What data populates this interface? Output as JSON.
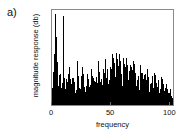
{
  "figure": {
    "panel_label": "a)",
    "background_color": "#ffffff",
    "axis_color": "#8a8a8a",
    "data_color": "#000000"
  },
  "chart_data": {
    "type": "area",
    "title": "",
    "subtitle": "",
    "xlabel": "frequency",
    "ylabel": "magnitude response (db)",
    "xlim": [
      0,
      104
    ],
    "ylim": [
      0,
      100
    ],
    "grid": false,
    "legend": null,
    "legend_position": "none",
    "xticks": [
      0,
      50,
      100
    ],
    "xticklabels": [
      "0",
      "50",
      "100"
    ],
    "yticks": [],
    "yticklabels": [],
    "x": [
      0,
      1,
      2,
      3,
      4,
      5,
      6,
      7,
      8,
      9,
      10,
      11,
      12,
      13,
      14,
      15,
      16,
      17,
      18,
      19,
      20,
      21,
      22,
      23,
      24,
      25,
      26,
      27,
      28,
      29,
      30,
      31,
      32,
      33,
      34,
      35,
      36,
      37,
      38,
      39,
      40,
      41,
      42,
      43,
      44,
      45,
      46,
      47,
      48,
      49,
      50,
      51,
      52,
      53,
      54,
      55,
      56,
      57,
      58,
      59,
      60,
      61,
      62,
      63,
      64,
      65,
      66,
      67,
      68,
      69,
      70,
      71,
      72,
      73,
      74,
      75,
      76,
      77,
      78,
      79,
      80,
      81,
      82,
      83,
      84,
      85,
      86,
      87,
      88,
      89,
      90,
      91,
      92,
      93,
      94,
      95,
      96,
      97,
      98,
      99,
      100,
      101,
      102,
      103
    ],
    "values": [
      18,
      30,
      52,
      96,
      72,
      34,
      26,
      40,
      28,
      22,
      94,
      66,
      30,
      24,
      58,
      40,
      26,
      20,
      44,
      30,
      22,
      18,
      46,
      28,
      20,
      32,
      48,
      30,
      22,
      26,
      34,
      44,
      28,
      24,
      38,
      30,
      26,
      42,
      34,
      28,
      46,
      36,
      30,
      50,
      40,
      34,
      48,
      42,
      36,
      52,
      44,
      38,
      54,
      46,
      40,
      56,
      48,
      42,
      54,
      46,
      40,
      52,
      44,
      38,
      50,
      42,
      36,
      48,
      40,
      34,
      46,
      38,
      32,
      44,
      36,
      30,
      42,
      34,
      28,
      40,
      32,
      27,
      38,
      30,
      25,
      36,
      28,
      23,
      34,
      26,
      21,
      32,
      24,
      20,
      29,
      22,
      18,
      26,
      20,
      16,
      22,
      17,
      13,
      10
    ],
    "baseline_values": [
      10,
      14,
      18,
      22,
      19,
      16,
      14,
      17,
      15,
      13,
      20,
      18,
      15,
      13,
      17,
      16,
      14,
      12,
      16,
      14,
      13,
      11,
      17,
      14,
      12,
      15,
      18,
      15,
      13,
      14,
      17,
      19,
      15,
      14,
      18,
      16,
      14,
      19,
      17,
      15,
      20,
      18,
      16,
      22,
      19,
      17,
      22,
      20,
      18,
      24,
      21,
      19,
      25,
      22,
      20,
      26,
      23,
      21,
      25,
      22,
      20,
      24,
      21,
      19,
      23,
      20,
      18,
      22,
      19,
      17,
      21,
      18,
      16,
      20,
      17,
      15,
      19,
      16,
      14,
      18,
      15,
      13,
      17,
      14,
      12,
      16,
      13,
      11,
      15,
      12,
      10,
      14,
      11,
      9,
      13,
      10,
      8,
      11,
      9,
      7,
      9,
      7,
      6,
      5
    ]
  }
}
